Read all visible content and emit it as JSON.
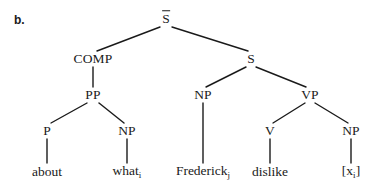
{
  "figure": {
    "item_label": "b.",
    "line_color": "#1a1a1a",
    "text_color": "#1a1a1a",
    "background_color": "#ffffff"
  },
  "nodes": {
    "sbar": {
      "label": "S",
      "sub": "",
      "overline": true,
      "x": 166,
      "y": 19
    },
    "comp": {
      "label": "COMP",
      "sub": "",
      "overline": false,
      "x": 93,
      "y": 59
    },
    "s": {
      "label": "S",
      "sub": "",
      "overline": false,
      "x": 251,
      "y": 59
    },
    "pp": {
      "label": "PP",
      "sub": "",
      "overline": false,
      "x": 93,
      "y": 95
    },
    "np_subject": {
      "label": "NP",
      "sub": "",
      "overline": false,
      "x": 203,
      "y": 95
    },
    "vp": {
      "label": "VP",
      "sub": "",
      "overline": false,
      "x": 310,
      "y": 95
    },
    "p": {
      "label": "P",
      "sub": "",
      "overline": false,
      "x": 47,
      "y": 131
    },
    "np_wh": {
      "label": "NP",
      "sub": "",
      "overline": false,
      "x": 127,
      "y": 131
    },
    "v": {
      "label": "V",
      "sub": "",
      "overline": false,
      "x": 270,
      "y": 131
    },
    "np_object": {
      "label": "NP",
      "sub": "",
      "overline": false,
      "x": 351,
      "y": 131
    },
    "about": {
      "label": "about",
      "sub": "",
      "overline": false,
      "x": 47,
      "y": 172
    },
    "what": {
      "label": "what",
      "sub": "i",
      "overline": false,
      "x": 127,
      "y": 172
    },
    "frederick": {
      "label": "Frederick",
      "sub": "j",
      "overline": false,
      "x": 203,
      "y": 172
    },
    "dislike": {
      "label": "dislike",
      "sub": "",
      "overline": false,
      "x": 270,
      "y": 172
    },
    "trace": {
      "label": "[x",
      "sub": "i",
      "overline": false,
      "x": 351,
      "y": 172,
      "suffix": "]"
    }
  },
  "edges": [
    {
      "name": "sbar-to-comp",
      "x1": 160,
      "y1": 27,
      "x2": 97,
      "y2": 51
    },
    {
      "name": "sbar-to-s",
      "x1": 172,
      "y1": 27,
      "x2": 248,
      "y2": 51
    },
    {
      "name": "comp-to-pp",
      "x1": 93,
      "y1": 67,
      "x2": 93,
      "y2": 87
    },
    {
      "name": "pp-to-p",
      "x1": 87,
      "y1": 103,
      "x2": 51,
      "y2": 123
    },
    {
      "name": "pp-to-np-wh",
      "x1": 99,
      "y1": 103,
      "x2": 124,
      "y2": 123
    },
    {
      "name": "s-to-np-subject",
      "x1": 246,
      "y1": 67,
      "x2": 206,
      "y2": 87
    },
    {
      "name": "s-to-vp",
      "x1": 256,
      "y1": 67,
      "x2": 306,
      "y2": 87
    },
    {
      "name": "np-subject-to-frederick",
      "x1": 203,
      "y1": 103,
      "x2": 203,
      "y2": 163
    },
    {
      "name": "vp-to-v",
      "x1": 305,
      "y1": 103,
      "x2": 273,
      "y2": 123
    },
    {
      "name": "vp-to-np-object",
      "x1": 315,
      "y1": 103,
      "x2": 348,
      "y2": 123
    },
    {
      "name": "p-to-about",
      "x1": 47,
      "y1": 139,
      "x2": 47,
      "y2": 163
    },
    {
      "name": "np-wh-to-what",
      "x1": 127,
      "y1": 139,
      "x2": 127,
      "y2": 163
    },
    {
      "name": "v-to-dislike",
      "x1": 270,
      "y1": 139,
      "x2": 270,
      "y2": 163
    },
    {
      "name": "np-object-to-trace",
      "x1": 351,
      "y1": 139,
      "x2": 351,
      "y2": 163
    }
  ]
}
